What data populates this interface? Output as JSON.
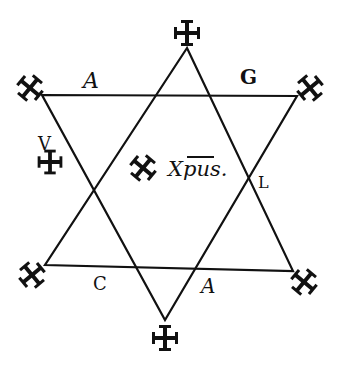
{
  "diagram": {
    "type": "hexagram",
    "colors": {
      "ink": "#111111",
      "paper": "#ffffff"
    },
    "labels": {
      "top_left_edge": "A",
      "top_right_edge": "G",
      "left_side_upper": "V",
      "left_side_lower": "H",
      "right_side": "L",
      "bottom_left_edge": "C",
      "bottom_right_edge": "A",
      "center_text": "Xpus."
    },
    "point_markers": [
      "cross",
      "cross",
      "cross",
      "cross",
      "cross",
      "cross"
    ],
    "center_marker": "cross"
  }
}
